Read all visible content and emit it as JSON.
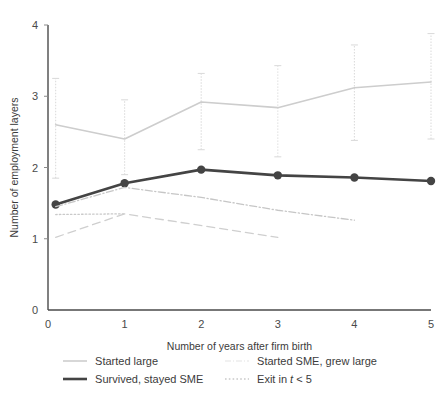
{
  "chart_data": {
    "type": "line",
    "title": "",
    "xlabel": "Number of years after firm birth",
    "ylabel": "Number of employment layers",
    "xlim": [
      0,
      5
    ],
    "ylim": [
      0,
      4
    ],
    "xticks": [
      0,
      1,
      2,
      3,
      4,
      5
    ],
    "yticks": [
      0,
      1,
      2,
      3,
      4
    ],
    "grid": false,
    "legend_position": "below",
    "x": [
      0,
      1,
      2,
      3,
      4,
      5
    ],
    "series": [
      {
        "name": "Started large",
        "style": "solid",
        "color": "#cdcdcd",
        "x": [
          0.1,
          1,
          2,
          3,
          4,
          5
        ],
        "values": [
          2.6,
          2.4,
          2.92,
          2.84,
          3.12,
          3.2
        ],
        "err_low": [
          1.85,
          1.9,
          2.25,
          2.15,
          2.38,
          2.4
        ],
        "err_high": [
          3.25,
          2.95,
          3.32,
          3.43,
          3.72,
          3.88
        ],
        "markers": false
      },
      {
        "name": "Survived, stayed SME",
        "style": "solid-thick",
        "color": "#444444",
        "x": [
          0.1,
          1,
          2,
          3,
          4,
          5
        ],
        "values": [
          1.48,
          1.78,
          1.97,
          1.89,
          1.86,
          1.81
        ],
        "err_low": [
          1.48,
          1.78,
          1.97,
          1.89,
          1.86,
          1.81
        ],
        "err_high": [
          1.48,
          1.78,
          1.97,
          1.89,
          1.86,
          1.81
        ],
        "markers": true
      },
      {
        "name": "Started SME, grew large",
        "style": "dashdot",
        "color": "#c6c6c6",
        "x": [
          0.1,
          1,
          2,
          3,
          4
        ],
        "values": [
          1.45,
          1.72,
          1.58,
          1.4,
          1.26
        ],
        "markers": false
      },
      {
        "name": "Exit in t < 5",
        "style": "dotted",
        "color": "#c9c9c9",
        "x": [
          0.1,
          1
        ],
        "values": [
          1.34,
          1.35
        ],
        "markers": false
      },
      {
        "name": "dashed-lower",
        "style": "dashed",
        "color": "#cfcfcf",
        "x": [
          0.1,
          1,
          3
        ],
        "values": [
          1.02,
          1.35,
          1.02
        ],
        "markers": false
      }
    ]
  },
  "axes": {
    "y_title": "Number of employment layers",
    "x_title": "Number of years after firm birth",
    "x_tick_labels": [
      "0",
      "1",
      "2",
      "3",
      "4",
      "5"
    ],
    "y_tick_labels": [
      "0",
      "1",
      "2",
      "3",
      "4"
    ]
  },
  "legend": {
    "entries": [
      {
        "label": "Started large",
        "key": "line-solid-light",
        "color": "#cdcdcd"
      },
      {
        "label": "Started SME, grew large",
        "key": "line-dashdot-light",
        "color": "#e2e2e2"
      },
      {
        "label": "Survived, stayed SME",
        "key": "line-solid-dark",
        "color": "#444444"
      },
      {
        "label": "Exit in t < 5",
        "key": "line-dotted-light",
        "color": "#c9c9c9"
      }
    ]
  },
  "colors": {
    "background": "#ffffff",
    "axis": "#4a4a4a",
    "text": "#3b3b3b",
    "series_dark": "#444444",
    "series_light": "#cdcdcd"
  }
}
